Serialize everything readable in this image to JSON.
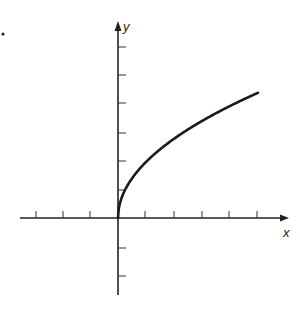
{
  "chart_data": {
    "type": "line",
    "title": "",
    "xlabel": "x",
    "ylabel": "y",
    "function": "y = 2*sqrt(x)",
    "x": [
      0,
      0.05,
      0.25,
      0.5,
      1,
      1.5,
      2,
      2.5,
      3,
      3.5,
      4,
      4.5,
      5
    ],
    "series": [
      {
        "name": "curve",
        "values": [
          0,
          0.45,
          1.0,
          1.41,
          2.0,
          2.45,
          2.83,
          3.16,
          3.46,
          3.74,
          4.0,
          4.24,
          4.47
        ]
      }
    ],
    "xlim": [
      -3.5,
      6
    ],
    "ylim": [
      -2.8,
      6.3
    ],
    "x_ticks": [
      -3,
      -2,
      -1,
      1,
      2,
      3,
      4,
      5
    ],
    "y_ticks": [
      -2,
      -1,
      1,
      2,
      3,
      4,
      5,
      6
    ],
    "tick_labels_shown": false,
    "grid": false,
    "legend": null
  },
  "labels": {
    "x_axis": "x",
    "y_axis": "y",
    "marker": "."
  }
}
